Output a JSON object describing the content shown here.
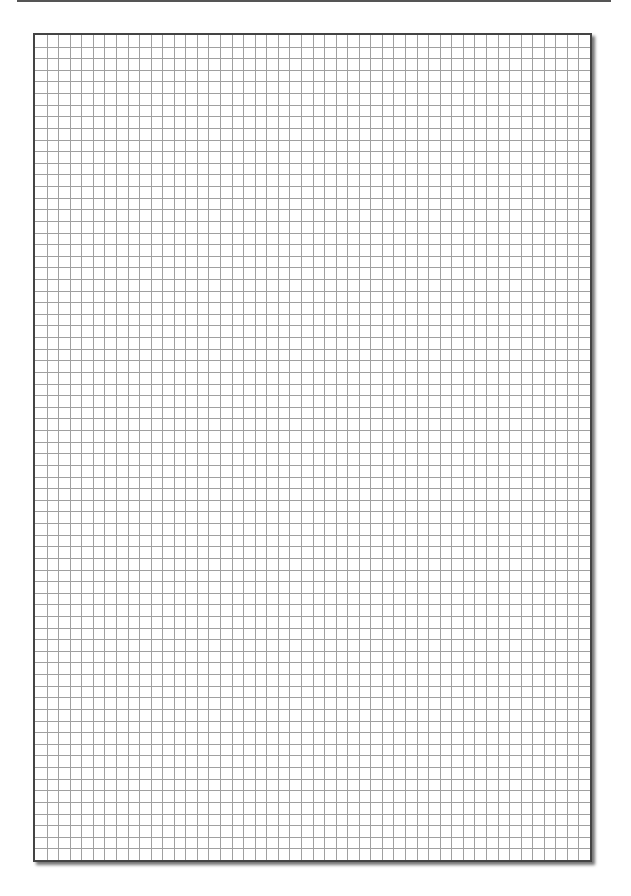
{
  "page": {
    "type": "graph-paper",
    "background": "#ffffff",
    "top_rule_color": "#555555"
  },
  "sheet": {
    "columns": 48,
    "rows": 71,
    "cell_size_px": 11.65,
    "grid_line_color": "#a0a0a0",
    "border_color": "#444444"
  }
}
